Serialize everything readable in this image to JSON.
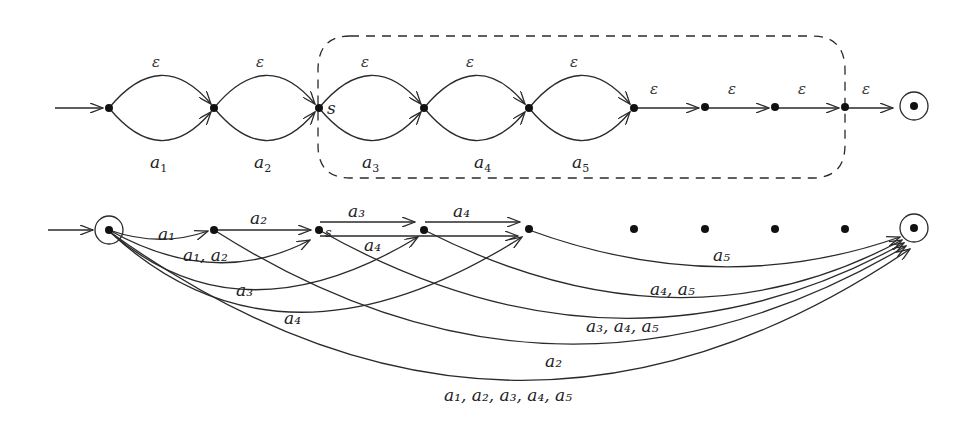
{
  "figure": {
    "top_automaton": {
      "state_label_s": "s",
      "epsilon": "ε",
      "loops": [
        {
          "top": "ε",
          "bottom": "a",
          "sub": "1"
        },
        {
          "top": "ε",
          "bottom": "a",
          "sub": "2"
        },
        {
          "top": "ε",
          "bottom": "a",
          "sub": "3"
        },
        {
          "top": "ε",
          "bottom": "a",
          "sub": "4"
        },
        {
          "top": "ε",
          "bottom": "a",
          "sub": "5"
        }
      ],
      "straight_epsilons": [
        "ε",
        "ε",
        "ε",
        "ε"
      ]
    },
    "bottom_automaton": {
      "state_label_s": "s",
      "edges": [
        {
          "id": "e-a1",
          "label": "a₁"
        },
        {
          "id": "e-a2-top",
          "label": "a₂"
        },
        {
          "id": "e-a3-top",
          "label": "a₃"
        },
        {
          "id": "e-a4-top",
          "label": "a₄"
        },
        {
          "id": "e-a1a2",
          "label": "a₁, a₂"
        },
        {
          "id": "e-a4-mid",
          "label": "a₄"
        },
        {
          "id": "e-a3",
          "label": "a₃"
        },
        {
          "id": "e-a4",
          "label": "a₄"
        },
        {
          "id": "e-a5",
          "label": "a₅"
        },
        {
          "id": "e-a4a5",
          "label": "a₄, a₅"
        },
        {
          "id": "e-a3a4a5",
          "label": "a₃, a₄, a₅"
        },
        {
          "id": "e-a2",
          "label": "a₂"
        },
        {
          "id": "e-all",
          "label": "a₁, a₂, a₃, a₄, a₅"
        }
      ]
    }
  }
}
